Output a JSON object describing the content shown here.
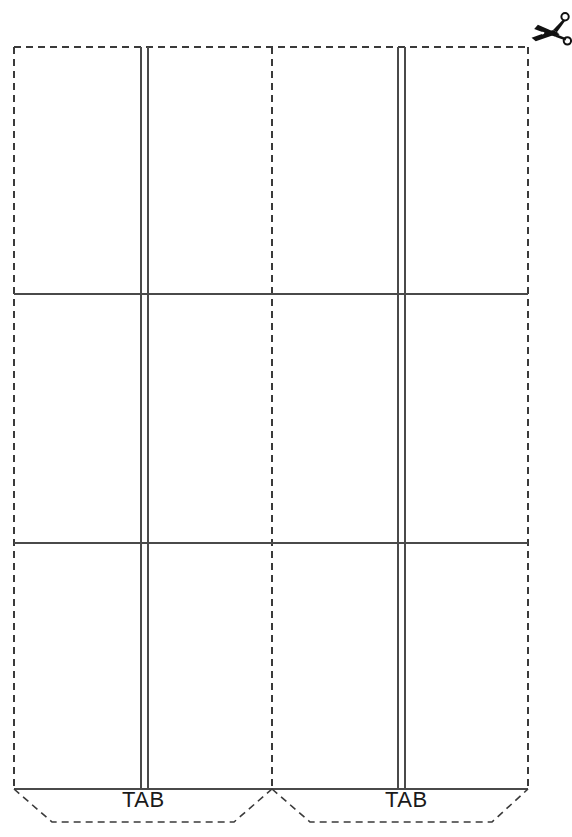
{
  "document": {
    "title": "Papercraft Envelope Template",
    "page_width": 572,
    "page_height": 837,
    "background_color": "#ffffff",
    "line_color": "#3a3a3a",
    "text_color": "#1a1a1a"
  },
  "icons": {
    "scissors": {
      "name": "scissors-icon",
      "label": "Cut here",
      "x": 528,
      "y": 8,
      "color": "#111111"
    }
  },
  "outline": {
    "style": "dashed",
    "description": "Outer cut line of template",
    "left_x": 14,
    "right_x": 528,
    "top_y": 47,
    "body_bottom_y": 789,
    "tabs_bottom_y": 822
  },
  "fold_lines": {
    "style": "solid",
    "horizontal": [
      {
        "name": "upper-fold",
        "y": 294,
        "x1": 14,
        "x2": 528
      },
      {
        "name": "lower-fold",
        "y": 543,
        "x1": 14,
        "x2": 528
      },
      {
        "name": "tab-fold",
        "y": 789,
        "x1": 14,
        "x2": 528
      }
    ],
    "vertical_pairs": [
      {
        "name": "left-gusset",
        "x1": 141,
        "x2": 148,
        "y1": 47,
        "y2": 789
      },
      {
        "name": "right-gusset",
        "x1": 398,
        "x2": 405,
        "y1": 47,
        "y2": 789
      }
    ]
  },
  "cut_lines": {
    "style": "dashed",
    "vertical": [
      {
        "name": "center-cut",
        "x": 272,
        "y1": 47,
        "y2": 789
      }
    ]
  },
  "tabs": [
    {
      "name": "tab-left",
      "label": "TAB",
      "top_left_x": 14,
      "top_right_x": 272,
      "bottom_left_x": 52,
      "bottom_right_x": 234,
      "top_y": 789,
      "bottom_y": 822
    },
    {
      "name": "tab-right",
      "label": "TAB",
      "top_left_x": 272,
      "top_right_x": 528,
      "bottom_left_x": 310,
      "bottom_right_x": 492,
      "top_y": 789,
      "bottom_y": 822
    }
  ]
}
